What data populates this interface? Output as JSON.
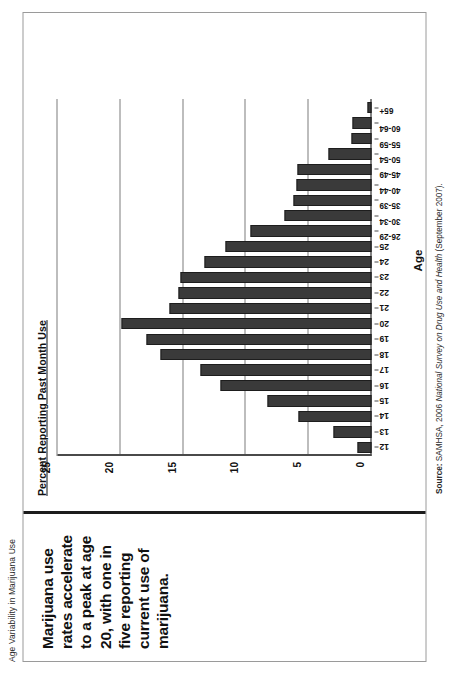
{
  "running_head": "Age Variability in Marijuana Use",
  "title": "Marijuana use rates accelerate to a peak at age 20, with one in five reporting current use of marijuana.",
  "y_axis_label": "Percent Reporting Past Month Use",
  "x_axis_title": "Age",
  "source": {
    "label": "Source:",
    "org": "SAMHSA, 2006",
    "survey": "National Survey on Drug Use and Health",
    "date": "(September 2007)."
  },
  "colors": {
    "bar": "#3a3a3a",
    "bar_edge": "#1d1d1d",
    "grid": "#7d7d7d",
    "axis": "#4a4a4a",
    "frame": "#9a9a9a",
    "title_rule": "#1c1c1c",
    "text": "#111111"
  },
  "chart_data": {
    "type": "bar",
    "title": "Marijuana use rates accelerate to a peak at age 20, with one in five reporting current use of marijuana.",
    "xlabel": "Age",
    "ylabel": "Percent Reporting Past Month Use",
    "ylim": [
      0,
      25
    ],
    "yticks": [
      0,
      5,
      10,
      15,
      20,
      25
    ],
    "grid": true,
    "legend": null,
    "categories": [
      "12",
      "13",
      "14",
      "15",
      "16",
      "17",
      "18",
      "19",
      "20",
      "21",
      "22",
      "23",
      "24",
      "25",
      "26-29",
      "30-34",
      "35-39",
      "40-44",
      "45-49",
      "50-54",
      "55-59",
      "60-64",
      "65+"
    ],
    "values": [
      1.1,
      3.0,
      5.8,
      8.3,
      12.0,
      13.6,
      16.8,
      17.9,
      19.9,
      16.1,
      15.4,
      15.2,
      13.3,
      11.6,
      9.6,
      6.9,
      6.2,
      6.0,
      5.9,
      3.4,
      1.6,
      1.5,
      0.3
    ]
  }
}
